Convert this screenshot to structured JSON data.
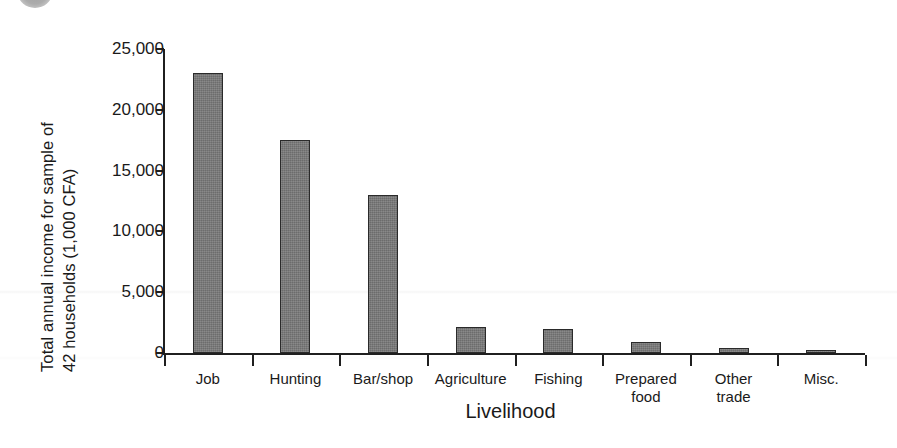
{
  "figure": {
    "badge_icon": "figure-number-badge-circle"
  },
  "chart_data": {
    "type": "bar",
    "title": "",
    "xlabel": "Livelihood",
    "ylabel_line1": "Total annual income for sample of",
    "ylabel_line2": "42 households (1,000 CFA)",
    "ylabel": "Total annual income for sample of 42 households (1,000 CFA)",
    "categories": [
      "Job",
      "Hunting",
      "Bar/shop",
      "Agriculture",
      "Fishing",
      "Prepared food",
      "Other trade",
      "Misc."
    ],
    "category_lines": [
      [
        "Job"
      ],
      [
        "Hunting"
      ],
      [
        "Bar/shop"
      ],
      [
        "Agriculture"
      ],
      [
        "Fishing"
      ],
      [
        "Prepared",
        "food"
      ],
      [
        "Other",
        "trade"
      ],
      [
        "Misc."
      ]
    ],
    "values": [
      23000,
      17500,
      13000,
      2100,
      1950,
      900,
      400,
      250
    ],
    "ylim": [
      0,
      25000
    ],
    "yticks": [
      0,
      5000,
      10000,
      15000,
      20000,
      25000
    ],
    "ytick_labels": [
      "0",
      "5,000",
      "10,000",
      "15,000",
      "20,000",
      "25,000"
    ],
    "grid": false,
    "legend": "none",
    "bar_color": "#787878",
    "bar_edge_color": "#2a2a2a",
    "axis_color": "#1f1f1f"
  }
}
